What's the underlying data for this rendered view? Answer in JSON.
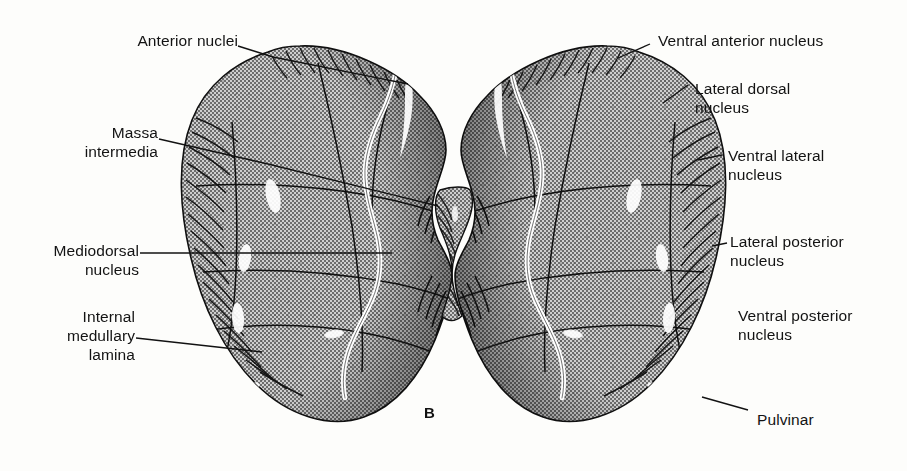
{
  "figure": {
    "panel_letter": "B",
    "ink_color": "#1a1a1a",
    "fill_tone": "#a8a8a8",
    "paper_color": "#fdfdfb",
    "highlight_color": "#ffffff"
  },
  "labels": {
    "left": [
      {
        "id": "anterior-nuclei",
        "text": "Anterior nuclei"
      },
      {
        "id": "massa-intermedia",
        "text": "Massa\nintermedia"
      },
      {
        "id": "mediodorsal-nucleus",
        "text": "Mediodorsal\nnucleus"
      },
      {
        "id": "internal-medullary-lamina",
        "text": "Internal\nmedullary\nlamina"
      }
    ],
    "right": [
      {
        "id": "ventral-anterior-nucleus",
        "text": "Ventral anterior nucleus"
      },
      {
        "id": "lateral-dorsal-nucleus",
        "text": "Lateral dorsal\nnucleus"
      },
      {
        "id": "ventral-lateral-nucleus",
        "text": "Ventral lateral\nnucleus"
      },
      {
        "id": "lateral-posterior-nucleus",
        "text": "Lateral posterior\nnucleus"
      },
      {
        "id": "ventral-posterior-nucleus",
        "text": "Ventral posterior\nnucleus"
      },
      {
        "id": "pulvinar",
        "text": "Pulvinar"
      }
    ]
  }
}
